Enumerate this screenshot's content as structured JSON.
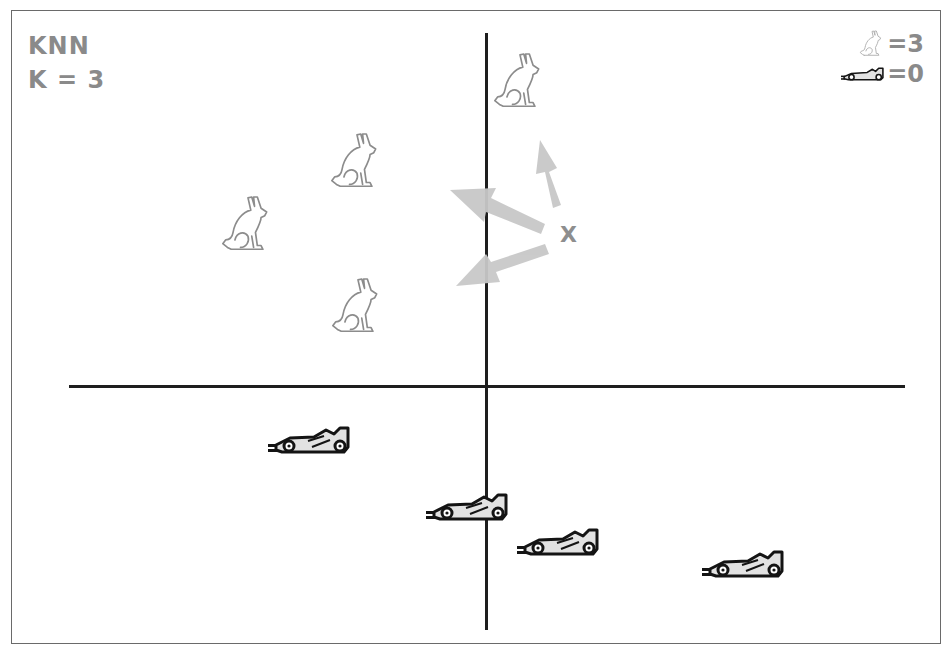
{
  "diagram": {
    "title": "KNN",
    "subtitle": "K = 3",
    "query_point_label": "X",
    "legend": {
      "rabbit_count": "=3",
      "car_count": "=0"
    },
    "colors": {
      "text": "#8a8a8a",
      "axis": "#1e1e1e",
      "arrow": "#c8c8c8",
      "rabbit_stroke": "#8c8c8c",
      "car_stroke": "#141414",
      "car_fill": "#e2e2e2"
    },
    "class_a": {
      "name": "rabbit",
      "icon": "rabbit-icon",
      "points": [
        {
          "x": 520,
          "y": 82
        },
        {
          "x": 357,
          "y": 162
        },
        {
          "x": 248,
          "y": 225
        },
        {
          "x": 358,
          "y": 307
        }
      ]
    },
    "class_b": {
      "name": "race-car",
      "icon": "race-car-icon",
      "points": [
        {
          "x": 310,
          "y": 440
        },
        {
          "x": 468,
          "y": 508
        },
        {
          "x": 559,
          "y": 543
        },
        {
          "x": 744,
          "y": 565
        }
      ]
    },
    "nearest_neighbor_arrows": [
      {
        "from": [
          557,
          205
        ],
        "to": [
          540,
          140
        ]
      },
      {
        "from": [
          545,
          228
        ],
        "to": [
          450,
          190
        ]
      },
      {
        "from": [
          548,
          248
        ],
        "to": [
          456,
          285
        ]
      }
    ]
  }
}
